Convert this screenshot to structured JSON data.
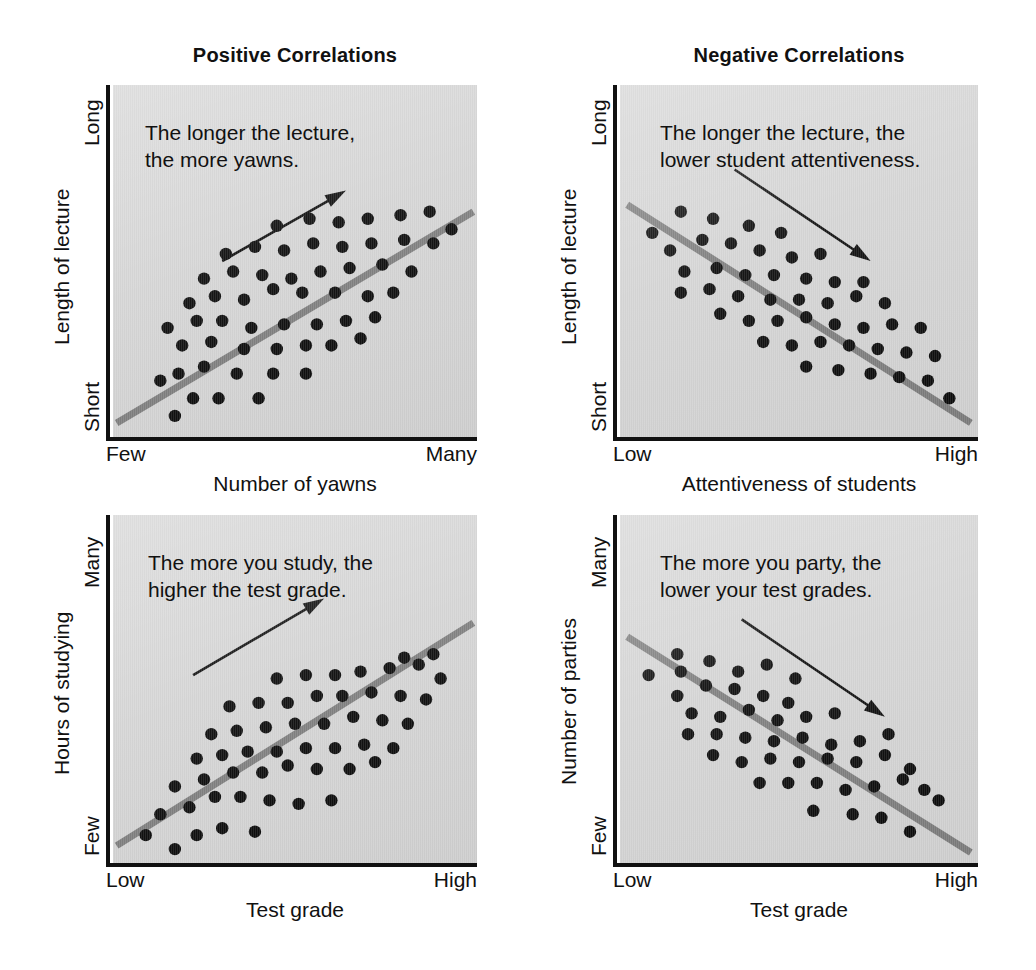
{
  "figure": {
    "background_color": "#ffffff",
    "plot_background_color": "#d4d4d4",
    "regression_line_color": "#7d7d7d",
    "dot_color": "#0a0a0a",
    "axis_color": "#111111"
  },
  "columns": [
    {
      "title": "Positive Correlations"
    },
    {
      "title": "Negative Correlations"
    }
  ],
  "panels": [
    {
      "id": "lecture-yawns",
      "caption": "The longer the lecture,\nthe more yawns.",
      "y_axis_title": "Length of lecture",
      "y_tick_top": "Long",
      "y_tick_bottom": "Short",
      "x_axis_title": "Number of yawns",
      "x_tick_left": "Few",
      "x_tick_right": "Many",
      "trend": "positive"
    },
    {
      "id": "lecture-attentiveness",
      "caption": "The longer the lecture, the\nlower student attentiveness.",
      "y_axis_title": "Length of lecture",
      "y_tick_top": "Long",
      "y_tick_bottom": "Short",
      "x_axis_title": "Attentiveness of students",
      "x_tick_left": "Low",
      "x_tick_right": "High",
      "trend": "negative"
    },
    {
      "id": "studying-grades",
      "caption": "The more you study, the\nhigher the test grade.",
      "y_axis_title": "Hours of studying",
      "y_tick_top": "Many",
      "y_tick_bottom": "Few",
      "x_axis_title": "Test grade",
      "x_tick_left": "Low",
      "x_tick_right": "High",
      "trend": "positive"
    },
    {
      "id": "parties-grades",
      "caption": "The more you party, the\nlower your test grades.",
      "y_axis_title": "Number of parties",
      "y_tick_top": "Many",
      "y_tick_bottom": "Few",
      "x_axis_title": "Test grade",
      "x_tick_left": "Low",
      "x_tick_right": "High",
      "trend": "negative"
    }
  ],
  "chart_data": [
    {
      "type": "scatter",
      "id": "lecture-yawns",
      "title": "Positive Correlations",
      "annotation": "The longer the lecture, the more yawns.",
      "xlabel": "Number of yawns",
      "ylabel": "Length of lecture",
      "xticklabels": [
        "Few",
        "Many"
      ],
      "yticklabels": [
        "Short",
        "Long"
      ],
      "xlim": [
        0,
        100
      ],
      "ylim": [
        0,
        100
      ],
      "grid": false,
      "legend": "none",
      "correlation": "positive",
      "trendline": {
        "x": [
          1,
          99
        ],
        "y": [
          4,
          64
        ]
      },
      "arrow": {
        "x": [
          30,
          64
        ],
        "y": [
          50,
          70
        ]
      },
      "points": [
        {
          "x": 17,
          "y": 6
        },
        {
          "x": 22,
          "y": 11
        },
        {
          "x": 29,
          "y": 11
        },
        {
          "x": 40,
          "y": 11
        },
        {
          "x": 13,
          "y": 16
        },
        {
          "x": 18,
          "y": 18
        },
        {
          "x": 25,
          "y": 20
        },
        {
          "x": 34,
          "y": 18
        },
        {
          "x": 44,
          "y": 18
        },
        {
          "x": 53,
          "y": 18
        },
        {
          "x": 19,
          "y": 26
        },
        {
          "x": 27,
          "y": 27
        },
        {
          "x": 36,
          "y": 25
        },
        {
          "x": 45,
          "y": 25
        },
        {
          "x": 53,
          "y": 26
        },
        {
          "x": 60,
          "y": 26
        },
        {
          "x": 68,
          "y": 28
        },
        {
          "x": 15,
          "y": 31
        },
        {
          "x": 23,
          "y": 33
        },
        {
          "x": 30,
          "y": 33
        },
        {
          "x": 38,
          "y": 31
        },
        {
          "x": 47,
          "y": 32
        },
        {
          "x": 56,
          "y": 32
        },
        {
          "x": 64,
          "y": 33
        },
        {
          "x": 72,
          "y": 34
        },
        {
          "x": 21,
          "y": 38
        },
        {
          "x": 28,
          "y": 40
        },
        {
          "x": 36,
          "y": 39
        },
        {
          "x": 44,
          "y": 42
        },
        {
          "x": 52,
          "y": 41
        },
        {
          "x": 61,
          "y": 41
        },
        {
          "x": 70,
          "y": 40
        },
        {
          "x": 77,
          "y": 41
        },
        {
          "x": 25,
          "y": 45
        },
        {
          "x": 33,
          "y": 47
        },
        {
          "x": 41,
          "y": 46
        },
        {
          "x": 49,
          "y": 45
        },
        {
          "x": 57,
          "y": 47
        },
        {
          "x": 65,
          "y": 48
        },
        {
          "x": 74,
          "y": 49
        },
        {
          "x": 82,
          "y": 47
        },
        {
          "x": 31,
          "y": 52
        },
        {
          "x": 39,
          "y": 54
        },
        {
          "x": 47,
          "y": 53
        },
        {
          "x": 55,
          "y": 55
        },
        {
          "x": 63,
          "y": 54
        },
        {
          "x": 71,
          "y": 55
        },
        {
          "x": 80,
          "y": 56
        },
        {
          "x": 88,
          "y": 55
        },
        {
          "x": 45,
          "y": 60
        },
        {
          "x": 54,
          "y": 62
        },
        {
          "x": 62,
          "y": 61
        },
        {
          "x": 70,
          "y": 62
        },
        {
          "x": 79,
          "y": 63
        },
        {
          "x": 87,
          "y": 64
        },
        {
          "x": 93,
          "y": 59
        }
      ]
    },
    {
      "type": "scatter",
      "id": "lecture-attentiveness",
      "title": "Negative Correlations",
      "annotation": "The longer the lecture, the lower student attentiveness.",
      "xlabel": "Attentiveness of students",
      "ylabel": "Length of lecture",
      "xticklabels": [
        "Low",
        "High"
      ],
      "yticklabels": [
        "Short",
        "Long"
      ],
      "xlim": [
        0,
        100
      ],
      "ylim": [
        0,
        100
      ],
      "grid": false,
      "legend": "none",
      "correlation": "negative",
      "trendline": {
        "x": [
          2,
          98
        ],
        "y": [
          66,
          4
        ]
      },
      "arrow": {
        "x": [
          32,
          70
        ],
        "y": [
          76,
          50
        ]
      },
      "points": [
        {
          "x": 9,
          "y": 58
        },
        {
          "x": 17,
          "y": 64
        },
        {
          "x": 26,
          "y": 62
        },
        {
          "x": 36,
          "y": 60
        },
        {
          "x": 45,
          "y": 58
        },
        {
          "x": 14,
          "y": 53
        },
        {
          "x": 23,
          "y": 56
        },
        {
          "x": 31,
          "y": 55
        },
        {
          "x": 39,
          "y": 53
        },
        {
          "x": 48,
          "y": 51
        },
        {
          "x": 56,
          "y": 52
        },
        {
          "x": 18,
          "y": 47
        },
        {
          "x": 27,
          "y": 48
        },
        {
          "x": 35,
          "y": 46
        },
        {
          "x": 43,
          "y": 46
        },
        {
          "x": 52,
          "y": 45
        },
        {
          "x": 60,
          "y": 44
        },
        {
          "x": 68,
          "y": 44
        },
        {
          "x": 17,
          "y": 41
        },
        {
          "x": 25,
          "y": 42
        },
        {
          "x": 33,
          "y": 40
        },
        {
          "x": 42,
          "y": 39
        },
        {
          "x": 50,
          "y": 39
        },
        {
          "x": 58,
          "y": 38
        },
        {
          "x": 66,
          "y": 40
        },
        {
          "x": 74,
          "y": 38
        },
        {
          "x": 28,
          "y": 35
        },
        {
          "x": 36,
          "y": 33
        },
        {
          "x": 44,
          "y": 33
        },
        {
          "x": 52,
          "y": 34
        },
        {
          "x": 60,
          "y": 32
        },
        {
          "x": 68,
          "y": 31
        },
        {
          "x": 76,
          "y": 32
        },
        {
          "x": 84,
          "y": 31
        },
        {
          "x": 40,
          "y": 27
        },
        {
          "x": 48,
          "y": 26
        },
        {
          "x": 56,
          "y": 27
        },
        {
          "x": 64,
          "y": 26
        },
        {
          "x": 72,
          "y": 25
        },
        {
          "x": 80,
          "y": 24
        },
        {
          "x": 88,
          "y": 23
        },
        {
          "x": 52,
          "y": 20
        },
        {
          "x": 61,
          "y": 19
        },
        {
          "x": 70,
          "y": 18
        },
        {
          "x": 78,
          "y": 17
        },
        {
          "x": 86,
          "y": 16
        },
        {
          "x": 92,
          "y": 11
        }
      ]
    },
    {
      "type": "scatter",
      "id": "studying-grades",
      "title": "Positive Correlations",
      "annotation": "The more you study, the higher the test grade.",
      "xlabel": "Test grade",
      "ylabel": "Hours of studying",
      "xticklabels": [
        "Low",
        "High"
      ],
      "yticklabels": [
        "Few",
        "Many"
      ],
      "xlim": [
        0,
        100
      ],
      "ylim": [
        0,
        100
      ],
      "grid": false,
      "legend": "none",
      "correlation": "positive",
      "trendline": {
        "x": [
          1,
          99
        ],
        "y": [
          5,
          69
        ]
      },
      "arrow": {
        "x": [
          22,
          58
        ],
        "y": [
          54,
          76
        ]
      },
      "points": [
        {
          "x": 9,
          "y": 8
        },
        {
          "x": 17,
          "y": 4
        },
        {
          "x": 23,
          "y": 8
        },
        {
          "x": 30,
          "y": 10
        },
        {
          "x": 39,
          "y": 9
        },
        {
          "x": 13,
          "y": 14
        },
        {
          "x": 21,
          "y": 16
        },
        {
          "x": 28,
          "y": 19
        },
        {
          "x": 35,
          "y": 19
        },
        {
          "x": 43,
          "y": 18
        },
        {
          "x": 51,
          "y": 17
        },
        {
          "x": 60,
          "y": 18
        },
        {
          "x": 17,
          "y": 22
        },
        {
          "x": 25,
          "y": 24
        },
        {
          "x": 33,
          "y": 26
        },
        {
          "x": 41,
          "y": 26
        },
        {
          "x": 48,
          "y": 28
        },
        {
          "x": 56,
          "y": 27
        },
        {
          "x": 65,
          "y": 27
        },
        {
          "x": 72,
          "y": 29
        },
        {
          "x": 23,
          "y": 30
        },
        {
          "x": 30,
          "y": 31
        },
        {
          "x": 37,
          "y": 32
        },
        {
          "x": 45,
          "y": 32
        },
        {
          "x": 53,
          "y": 33
        },
        {
          "x": 61,
          "y": 33
        },
        {
          "x": 69,
          "y": 34
        },
        {
          "x": 77,
          "y": 33
        },
        {
          "x": 27,
          "y": 37
        },
        {
          "x": 34,
          "y": 38
        },
        {
          "x": 42,
          "y": 39
        },
        {
          "x": 50,
          "y": 40
        },
        {
          "x": 58,
          "y": 40
        },
        {
          "x": 66,
          "y": 42
        },
        {
          "x": 74,
          "y": 41
        },
        {
          "x": 81,
          "y": 40
        },
        {
          "x": 32,
          "y": 45
        },
        {
          "x": 40,
          "y": 46
        },
        {
          "x": 48,
          "y": 46
        },
        {
          "x": 56,
          "y": 48
        },
        {
          "x": 63,
          "y": 48
        },
        {
          "x": 71,
          "y": 49
        },
        {
          "x": 79,
          "y": 48
        },
        {
          "x": 86,
          "y": 47
        },
        {
          "x": 45,
          "y": 53
        },
        {
          "x": 53,
          "y": 54
        },
        {
          "x": 61,
          "y": 54
        },
        {
          "x": 68,
          "y": 55
        },
        {
          "x": 76,
          "y": 56
        },
        {
          "x": 84,
          "y": 57
        },
        {
          "x": 90,
          "y": 53
        },
        {
          "x": 88,
          "y": 60
        },
        {
          "x": 80,
          "y": 59
        }
      ]
    },
    {
      "type": "scatter",
      "id": "parties-grades",
      "title": "Negative Correlations",
      "annotation": "The more you party, the lower your test grades.",
      "xlabel": "Test grade",
      "ylabel": "Number of parties",
      "xticklabels": [
        "Low",
        "High"
      ],
      "yticklabels": [
        "Few",
        "Many"
      ],
      "xlim": [
        0,
        100
      ],
      "ylim": [
        0,
        100
      ],
      "grid": false,
      "legend": "none",
      "correlation": "negative",
      "trendline": {
        "x": [
          2,
          98
        ],
        "y": [
          65,
          3
        ]
      },
      "arrow": {
        "x": [
          34,
          74
        ],
        "y": [
          70,
          42
        ]
      },
      "points": [
        {
          "x": 8,
          "y": 54
        },
        {
          "x": 16,
          "y": 60
        },
        {
          "x": 17,
          "y": 55
        },
        {
          "x": 25,
          "y": 58
        },
        {
          "x": 33,
          "y": 55
        },
        {
          "x": 41,
          "y": 57
        },
        {
          "x": 49,
          "y": 53
        },
        {
          "x": 16,
          "y": 48
        },
        {
          "x": 24,
          "y": 51
        },
        {
          "x": 32,
          "y": 50
        },
        {
          "x": 40,
          "y": 48
        },
        {
          "x": 47,
          "y": 46
        },
        {
          "x": 20,
          "y": 43
        },
        {
          "x": 28,
          "y": 42
        },
        {
          "x": 36,
          "y": 44
        },
        {
          "x": 44,
          "y": 41
        },
        {
          "x": 52,
          "y": 42
        },
        {
          "x": 60,
          "y": 43
        },
        {
          "x": 19,
          "y": 37
        },
        {
          "x": 27,
          "y": 37
        },
        {
          "x": 35,
          "y": 36
        },
        {
          "x": 43,
          "y": 35
        },
        {
          "x": 51,
          "y": 36
        },
        {
          "x": 59,
          "y": 34
        },
        {
          "x": 67,
          "y": 35
        },
        {
          "x": 75,
          "y": 37
        },
        {
          "x": 26,
          "y": 31
        },
        {
          "x": 34,
          "y": 29
        },
        {
          "x": 42,
          "y": 30
        },
        {
          "x": 50,
          "y": 29
        },
        {
          "x": 58,
          "y": 30
        },
        {
          "x": 66,
          "y": 29
        },
        {
          "x": 74,
          "y": 31
        },
        {
          "x": 81,
          "y": 27
        },
        {
          "x": 39,
          "y": 23
        },
        {
          "x": 47,
          "y": 23
        },
        {
          "x": 55,
          "y": 23
        },
        {
          "x": 63,
          "y": 21
        },
        {
          "x": 71,
          "y": 22
        },
        {
          "x": 79,
          "y": 24
        },
        {
          "x": 85,
          "y": 21
        },
        {
          "x": 89,
          "y": 18
        },
        {
          "x": 54,
          "y": 15
        },
        {
          "x": 65,
          "y": 14
        },
        {
          "x": 73,
          "y": 13
        },
        {
          "x": 81,
          "y": 9
        }
      ]
    }
  ]
}
